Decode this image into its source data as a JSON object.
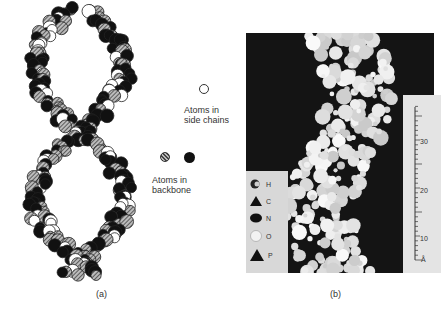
{
  "figure": {
    "panel_a": {
      "caption": "(a)",
      "legend": {
        "side_chain_label_line1": "Atoms in",
        "side_chain_label_line2": "side chains",
        "backbone_label_line1": "Atoms in",
        "backbone_label_line2": "backbone"
      },
      "description": "Space-filling drawing of a double helix with open circles (side chains) and hatched/solid circles (backbone)"
    },
    "panel_b": {
      "caption": "(b)",
      "legend": [
        {
          "symbol": "half-circle",
          "label": "H"
        },
        {
          "symbol": "triangle",
          "label": "C"
        },
        {
          "symbol": "dark-oval",
          "label": "N"
        },
        {
          "symbol": "light-circle",
          "label": "O"
        },
        {
          "symbol": "triangle-large",
          "label": "P"
        }
      ],
      "scale": {
        "labels": [
          "30",
          "20",
          "10",
          "Å"
        ]
      },
      "description": "Photograph of a space-filling molecular model of a double helix on a black background"
    }
  },
  "colors": {
    "background": "#ffffff",
    "photo_background": "#141414",
    "ink": "#111111"
  }
}
